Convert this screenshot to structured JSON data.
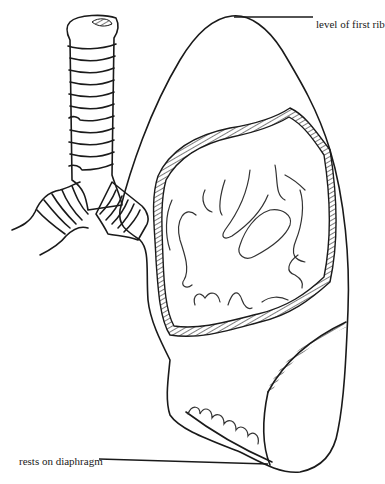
{
  "figure": {
    "style": "black line drawing on white",
    "colors": {
      "line": "#1a1a1a",
      "background": "#ffffff"
    }
  },
  "labels": {
    "top": "level of first rib",
    "bottom": "rests on diaphragm"
  },
  "parts": [
    "trachea",
    "bronchus",
    "lung apex",
    "lung surface (scale texture)",
    "hilum region",
    "pulmonary vessels",
    "base of lung"
  ]
}
